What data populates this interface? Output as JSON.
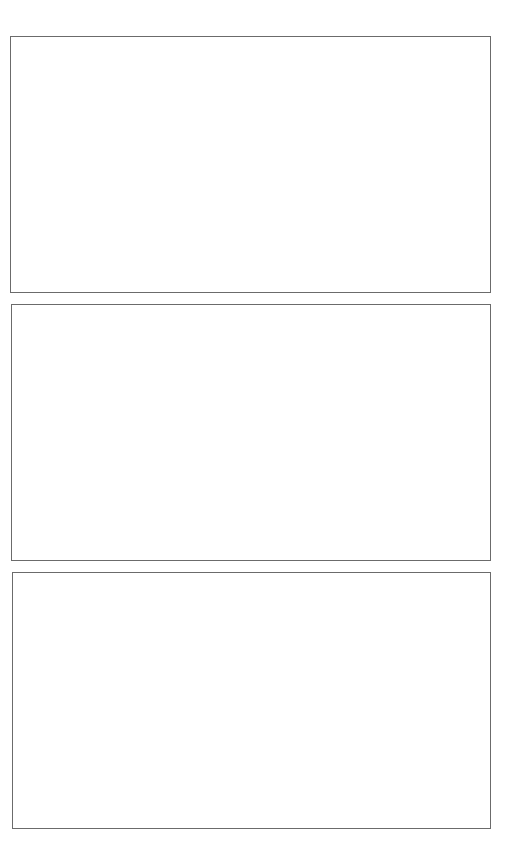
{
  "colors": {
    "background": "#ffffff",
    "panel_border": "#6b6b6b"
  },
  "panels": [
    {
      "label": ""
    },
    {
      "label": ""
    },
    {
      "label": ""
    }
  ]
}
